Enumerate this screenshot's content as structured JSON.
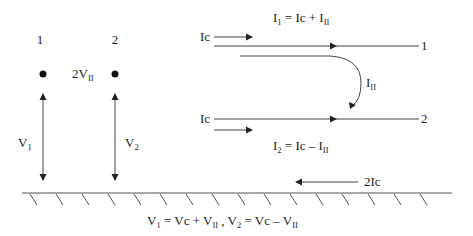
{
  "diagram": {
    "conductors": [
      {
        "id": "1",
        "label": "1"
      },
      {
        "id": "2",
        "label": "2"
      }
    ],
    "left_panel": {
      "node_labels": [
        "1",
        "2"
      ],
      "diff_voltage": {
        "main": "2V",
        "sub": "II"
      },
      "v1": {
        "main": "V",
        "sub": "1"
      },
      "v2": {
        "main": "V",
        "sub": "2"
      }
    },
    "right_panel": {
      "ic_top": "Ic",
      "ic_bottom": "Ic",
      "i1_eq": {
        "main": "I",
        "sub": "1",
        "rest": " = Ic + I",
        "sub2": "II"
      },
      "i2_eq": {
        "main": "I",
        "sub": "2",
        "rest": " = Ic – I",
        "sub2": "II"
      },
      "iii_label": {
        "main": "I",
        "sub": "II"
      },
      "line1_label": "1",
      "line2_label": "2",
      "ground_current": "2Ic"
    },
    "bottom_eq": {
      "v1": "V",
      "v1_sub": "1",
      "v1_rest": " = Vc + V",
      "v1_sub2": "II",
      "sep": " , ",
      "v2": "V",
      "v2_sub": "2",
      "v2_rest": " = Vc – V",
      "v2_sub2": "II"
    }
  }
}
